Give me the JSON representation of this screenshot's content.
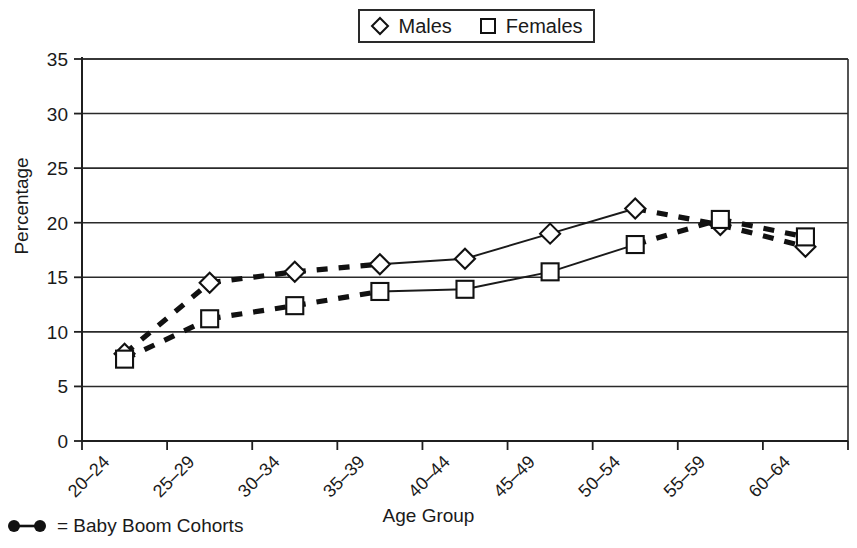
{
  "chart_data": {
    "type": "line",
    "title": "",
    "xlabel": "Age Group",
    "ylabel": "Percentage",
    "categories": [
      "20–24",
      "25–29",
      "30–34",
      "35–39",
      "40–44",
      "45–49",
      "50–54",
      "55–59",
      "60–64"
    ],
    "ylim": [
      0,
      35
    ],
    "yticks": [
      0,
      5,
      10,
      15,
      20,
      25,
      30,
      35
    ],
    "ytick_labels": [
      "0",
      "5",
      "10",
      "15",
      "20",
      "25",
      "30",
      "35"
    ],
    "grid": "horizontal",
    "legend_position": "top-center",
    "series": [
      {
        "name": "Males",
        "marker": "diamond",
        "values": [
          8.0,
          14.5,
          15.5,
          16.2,
          16.7,
          19.0,
          21.3,
          19.8,
          17.8
        ],
        "dashed_segments": [
          [
            0,
            1
          ],
          [
            1,
            2
          ],
          [
            2,
            3
          ],
          [
            6,
            7
          ],
          [
            7,
            8
          ]
        ]
      },
      {
        "name": "Females",
        "marker": "square",
        "values": [
          7.5,
          11.2,
          12.4,
          13.7,
          13.9,
          15.5,
          18.0,
          20.3,
          18.7
        ],
        "dashed_segments": [
          [
            0,
            1
          ],
          [
            1,
            2
          ],
          [
            2,
            3
          ],
          [
            6,
            7
          ],
          [
            7,
            8
          ]
        ]
      }
    ]
  },
  "legend": {
    "items": [
      {
        "label": "Males",
        "marker": "diamond"
      },
      {
        "label": "Females",
        "marker": "square"
      }
    ]
  },
  "footnote": {
    "symbol": "●—●",
    "text": "= Baby Boom Cohorts"
  },
  "axis": {
    "y_title": "Percentage",
    "x_title": "Age Group"
  }
}
